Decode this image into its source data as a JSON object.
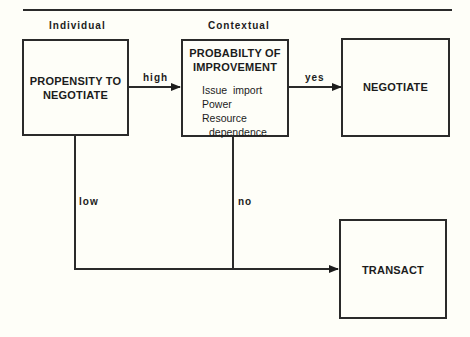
{
  "diagram": {
    "column_headers": {
      "individual": "Individual",
      "contextual": "Contextual"
    },
    "nodes": {
      "propensity": {
        "title_line1": "PROPENSITY TO",
        "title_line2": "NEGOTIATE"
      },
      "probability": {
        "title_line1": "PROBABILTY OF",
        "title_line2": "IMPROVEMENT",
        "factors": [
          "Issue  import",
          "Power",
          "Resource",
          "dependence"
        ]
      },
      "negotiate": {
        "title": "NEGOTIATE"
      },
      "transact": {
        "title": "TRANSACT"
      }
    },
    "edges": {
      "high": "high",
      "yes": "yes",
      "low": "low",
      "no": "no"
    }
  }
}
